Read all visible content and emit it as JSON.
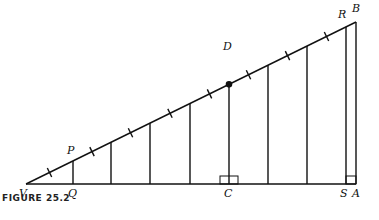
{
  "caption": "FIGURE   25.2",
  "colors": {
    "stroke": "#111111",
    "background": "#ffffff"
  },
  "points": {
    "V": {
      "label": "V",
      "x": 26,
      "y": 184
    },
    "A": {
      "label": "A",
      "x": 356,
      "y": 184
    },
    "B": {
      "label": "B",
      "x": 356,
      "y": 22
    },
    "P": {
      "label": "P",
      "x": 73,
      "y": 161
    },
    "Q": {
      "label": "Q",
      "x": 73,
      "y": 184
    },
    "D": {
      "label": "D",
      "x": 229,
      "y": 84
    },
    "C": {
      "label": "C",
      "x": 229,
      "y": 184
    },
    "R": {
      "label": "R",
      "x": 346,
      "y": 27
    },
    "S": {
      "label": "S",
      "x": 346,
      "y": 184
    }
  },
  "vertical_segments_x": [
    73,
    111,
    150,
    190,
    229,
    268,
    307,
    346
  ],
  "right_angle_marks": [
    "C",
    "A"
  ]
}
